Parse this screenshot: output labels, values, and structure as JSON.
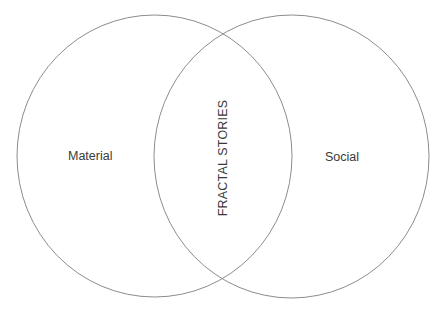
{
  "diagram": {
    "type": "venn",
    "stroke_color": "#8c8c8c",
    "background": "#ffffff",
    "sets": [
      {
        "id": "left",
        "label": "Material"
      },
      {
        "id": "right",
        "label": "Social"
      }
    ],
    "intersection": {
      "label": "FRACTAL STORIES",
      "orientation": "vertical"
    }
  }
}
